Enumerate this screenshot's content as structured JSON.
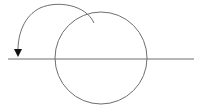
{
  "diagram": {
    "colors": {
      "background": "#ffffff",
      "stroke": "#6e6e6e",
      "arrowhead": "#111111"
    },
    "shapes": {
      "circle": {
        "cx": 101,
        "cy": 58,
        "r": 46
      },
      "line": {
        "x1": 8,
        "y1": 59,
        "x2": 194,
        "y2": 59
      },
      "rotation_arrow": {
        "direction": "counter-clockwise",
        "path": "M 94 23 A 40 40 0 0 0 18 52",
        "head_tip": [
          18,
          57
        ]
      }
    }
  }
}
